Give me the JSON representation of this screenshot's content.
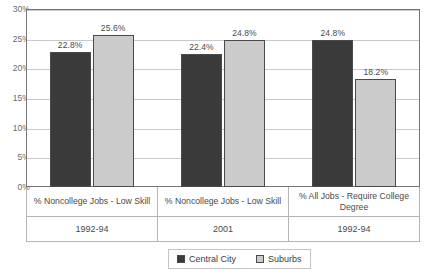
{
  "chart_data": {
    "type": "bar",
    "title": "",
    "xlabel": "",
    "ylabel": "",
    "ylim": [
      0,
      30
    ],
    "grid": true,
    "legend_position": "bottom",
    "categories": [
      "% Noncollege Jobs - Low Skill",
      "% Noncollege Jobs - Low Skill",
      "% All Jobs - Require College Degree"
    ],
    "group_years": [
      "1992-94",
      "2001",
      "1992-94"
    ],
    "yticks": [
      0,
      5,
      10,
      15,
      20,
      25,
      30
    ],
    "ytick_labels": [
      "0%",
      "5%",
      "10%",
      "15%",
      "20%",
      "25%",
      "30%"
    ],
    "series": [
      {
        "name": "Central City",
        "color": "#3a3a3a",
        "values": [
          22.8,
          22.4,
          24.8
        ],
        "labels": [
          "22.8%",
          "22.4%",
          "24.8%"
        ]
      },
      {
        "name": "Suburbs",
        "color": "#cbcbcb",
        "values": [
          25.6,
          24.8,
          18.2
        ],
        "labels": [
          "25.6%",
          "24.8%",
          "18.2%"
        ]
      }
    ]
  },
  "legend": {
    "items": [
      {
        "label": "Central City",
        "swatch": "central"
      },
      {
        "label": "Suburbs",
        "swatch": "suburb"
      }
    ]
  }
}
